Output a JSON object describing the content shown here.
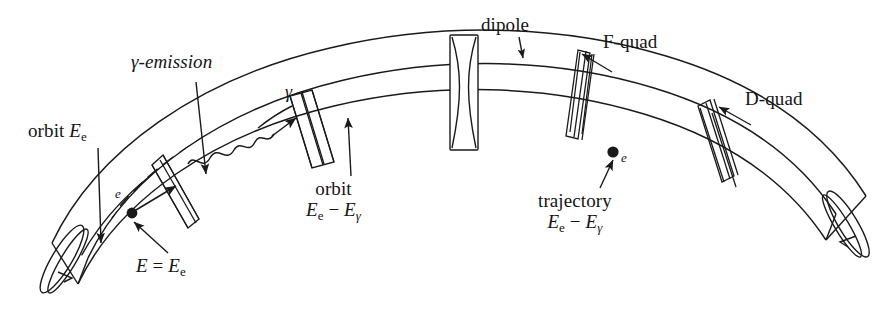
{
  "figure": {
    "kind": "accelerator-arc-schematic",
    "background": "#ffffff",
    "ink": "#1a1a1a",
    "width": 896,
    "height": 310
  },
  "labels": {
    "gamma_emission": "γ-emission",
    "orbit_ee_text": "orbit",
    "orbit_ee_energy_E": "E",
    "orbit_ee_energy_sub": "e",
    "dipole": "dipole",
    "f_quad": "F-quad",
    "d_quad": "D-quad",
    "orbit_reduced_line1": "orbit",
    "trajectory_line1": "trajectory",
    "energy_reduced_E1": "E",
    "energy_reduced_sub1": "e",
    "energy_reduced_minus": "−",
    "energy_reduced_E2": "E",
    "energy_reduced_sub2": "γ",
    "E_equals_E_e_lhs": "E",
    "E_equals_sign": "=",
    "E_equals_E_e_rhs": "E",
    "E_equals_E_e_sub": "e",
    "electron_1": "e",
    "electron_2": "e",
    "photon": "γ"
  },
  "elements": {
    "dipoles": [
      {
        "name": "dipole-1",
        "position": "far-left"
      },
      {
        "name": "dipole-2",
        "position": "left"
      },
      {
        "name": "dipole-3",
        "position": "center-left"
      },
      {
        "name": "dipole-4",
        "position": "center-right"
      },
      {
        "name": "dipole-5",
        "position": "right"
      }
    ],
    "quadrupoles": [
      {
        "name": "quad-left",
        "type": "D-quad",
        "position": "left"
      },
      {
        "name": "quad-center",
        "type": "F-quad",
        "position": "center",
        "shape": "bowtie"
      },
      {
        "name": "quad-f",
        "type": "F-quad",
        "position": "center-right"
      },
      {
        "name": "quad-d",
        "type": "D-quad",
        "position": "right"
      }
    ],
    "orbit_lines": [
      {
        "name": "orbit-Ee",
        "style": "solid",
        "meaning": "design orbit at energy E_e"
      },
      {
        "name": "orbit-reduced",
        "style": "dashed",
        "meaning": "orbit for energy E_e - E_gamma"
      },
      {
        "name": "trajectory-reduced",
        "style": "solid",
        "meaning": "actual trajectory after photon emission"
      }
    ],
    "electrons": [
      {
        "name": "electron-entry",
        "label": "e"
      },
      {
        "name": "electron-post-emission",
        "label": "e"
      }
    ],
    "photon": {
      "name": "gamma-photon",
      "label": "γ",
      "style": "wavy-arrow"
    }
  }
}
